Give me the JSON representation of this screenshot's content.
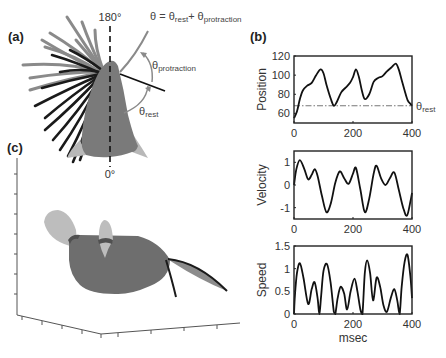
{
  "panels": {
    "a": {
      "label": "(a)"
    },
    "b": {
      "label": "(b)"
    },
    "c": {
      "label": "(c)"
    }
  },
  "panel_a": {
    "top_angle_label": "180°",
    "bottom_angle_label": "0°",
    "equation": {
      "lhs": "θ = θ",
      "rest_sub": "rest",
      "plus": "+ θ",
      "prot_sub": "protraction"
    },
    "theta_protraction": {
      "sym": "θ",
      "sub": "protraction"
    },
    "theta_rest": {
      "sym": "θ",
      "sub": "rest"
    },
    "colors": {
      "head": "#7a7a7a",
      "whisker_dark": "#1a1a1a",
      "whisker_light": "#8a8a8a",
      "ear": "#b8b8b8",
      "arc": "#8a8a8a"
    }
  },
  "panel_c": {
    "colors": {
      "body": "#6e6e6e",
      "ear": "#bdbdbd",
      "whisker": "#1a1a1a"
    }
  },
  "chart_data": [
    {
      "type": "line",
      "title": "",
      "xlabel": "",
      "ylabel": "Position",
      "xlim": [
        0,
        400
      ],
      "ylim": [
        50,
        120
      ],
      "xticks": [
        0,
        200,
        400
      ],
      "yticks": [
        60,
        80,
        100,
        120
      ],
      "grid": false,
      "reference_line": {
        "y": 68,
        "label_sym": "θ",
        "label_sub": "rest",
        "style": "dash-dot"
      },
      "x": [
        0,
        10,
        20,
        30,
        45,
        60,
        75,
        90,
        100,
        110,
        125,
        135,
        145,
        160,
        175,
        190,
        200,
        210,
        220,
        230,
        240,
        255,
        270,
        285,
        300,
        315,
        330,
        345,
        355,
        365,
        375,
        385,
        395,
        400
      ],
      "values": [
        55,
        62,
        75,
        84,
        89,
        92,
        100,
        106,
        102,
        90,
        75,
        68,
        72,
        82,
        87,
        92,
        98,
        106,
        98,
        84,
        75,
        80,
        93,
        97,
        99,
        104,
        108,
        112,
        106,
        95,
        84,
        74,
        70,
        68
      ]
    },
    {
      "type": "line",
      "title": "",
      "xlabel": "",
      "ylabel": "Velocity",
      "xlim": [
        0,
        400
      ],
      "ylim": [
        -1.5,
        1.5
      ],
      "xticks": [
        0,
        200,
        400
      ],
      "yticks": [
        -1,
        0,
        1
      ],
      "grid": false,
      "x": [
        0,
        8,
        20,
        35,
        48,
        60,
        70,
        80,
        95,
        110,
        125,
        140,
        155,
        170,
        185,
        200,
        210,
        225,
        240,
        255,
        270,
        280,
        295,
        310,
        325,
        340,
        355,
        370,
        383,
        395,
        400
      ],
      "values": [
        0.0,
        0.7,
        1.1,
        0.7,
        0.25,
        0.45,
        0.7,
        0.4,
        -0.5,
        -1.2,
        -0.8,
        0.1,
        0.6,
        0.3,
        0.05,
        0.5,
        0.75,
        -0.2,
        -1.2,
        -0.6,
        0.5,
        0.85,
        0.3,
        0.0,
        0.3,
        0.55,
        -0.2,
        -1.0,
        -1.35,
        -0.7,
        -0.35
      ]
    },
    {
      "type": "line",
      "title": "",
      "xlabel": "msec",
      "ylabel": "Speed",
      "xlim": [
        0,
        400
      ],
      "ylim": [
        0,
        1.5
      ],
      "xticks": [
        0,
        200,
        400
      ],
      "yticks": [
        0,
        0.5,
        1,
        1.5
      ],
      "ytick_labels": [
        "0",
        "0.5",
        "1",
        "1.5"
      ],
      "grid": false,
      "x": [
        0,
        3,
        10,
        20,
        32,
        48,
        60,
        70,
        80,
        86,
        92,
        100,
        112,
        124,
        135,
        140,
        148,
        158,
        170,
        180,
        192,
        205,
        215,
        225,
        232,
        240,
        248,
        258,
        268,
        280,
        292,
        303,
        315,
        328,
        340,
        350,
        358,
        365,
        375,
        385,
        395,
        400
      ],
      "values": [
        0,
        0.4,
        0.9,
        1.12,
        0.8,
        0.22,
        0.55,
        0.7,
        0.35,
        0.0,
        0.4,
        0.95,
        1.1,
        0.7,
        0.05,
        0.0,
        0.35,
        0.6,
        0.45,
        0.1,
        0.5,
        0.78,
        0.5,
        0.1,
        0.0,
        0.9,
        1.18,
        0.9,
        0.3,
        0.8,
        0.6,
        0.2,
        0.05,
        0.35,
        0.55,
        0.3,
        0.0,
        0.6,
        1.15,
        1.3,
        0.8,
        0.35
      ]
    }
  ]
}
